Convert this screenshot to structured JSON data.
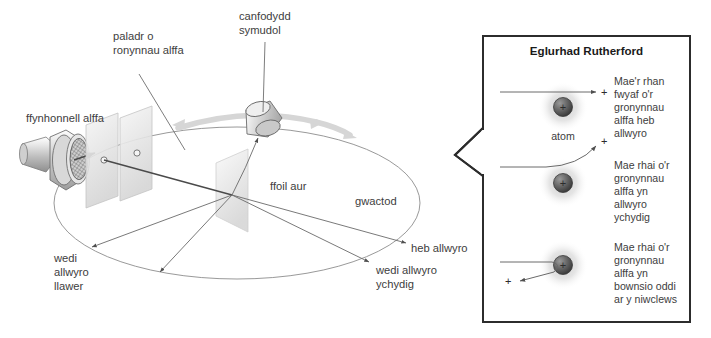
{
  "figure": {
    "background_color": "#ffffff"
  },
  "experiment": {
    "labels": {
      "alpha_source": "ffynhonnell alffa",
      "alpha_beam": "paladr o\nronynnau alffa",
      "alpha_beam_line1": "paladr o",
      "alpha_beam_line2": "ronynnau alffa",
      "movable_detector_line1": "canfodydd",
      "movable_detector_line2": "symudol",
      "gold_foil": "ffoil aur",
      "vacuum": "gwactod",
      "deflected_a_lot_line1": "wedi",
      "deflected_a_lot_line2": "allwyro",
      "deflected_a_lot_line3": "llawer",
      "undeflected": "heb allwyro",
      "deflected_slightly_line1": "wedi allwyro",
      "deflected_slightly_line2": "ychydig"
    }
  },
  "panel": {
    "title": "Eglurhad Rutherford",
    "atom_caption": "atom",
    "border_color": "#2c2c2c",
    "rows": [
      {
        "id": "undeflected",
        "charge_symbol": "+",
        "caption_lines": [
          "Mae'r rhan",
          "fwyaf o'r",
          "gronynnau",
          "alffa heb",
          "allwyro"
        ]
      },
      {
        "id": "slightly-deflected",
        "charge_symbol": "+",
        "caption_lines": [
          "Mae rhai o'r",
          "gronynnau",
          "alffa yn",
          "allwyro",
          "ychydig"
        ]
      },
      {
        "id": "backscattered",
        "charge_symbol": "+",
        "caption_lines": [
          "Mae rhai o'r",
          "gronynnau",
          "alffa yn",
          "bownsio oddi",
          "ar y niwclews"
        ]
      }
    ]
  },
  "colors": {
    "ink": "#3d3d3d",
    "line": "#6a6a6a",
    "beam": "#4a4a4a",
    "nucleus_dark": "#4a4a4a",
    "halo": "#d8d8d8",
    "metal_light": "#f2f2f2",
    "metal_mid": "#bcbcbc",
    "motion_arrow": "#d4d4d4"
  }
}
